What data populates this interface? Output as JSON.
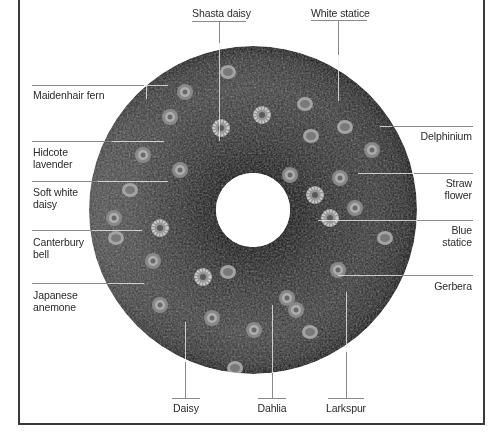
{
  "figure": {
    "colors": {
      "frame": "#3a3a3a",
      "leader_line": "#8a8a8a",
      "text": "#2a2a2a",
      "wreath_dark": "#141414"
    }
  },
  "labels": {
    "top": [
      {
        "id": "shasta-daisy",
        "text": "Shasta daisy"
      },
      {
        "id": "white-statice",
        "text": "White statice"
      }
    ],
    "left": [
      {
        "id": "maidenhair-fern",
        "lines": [
          "Maidenhair fern"
        ]
      },
      {
        "id": "hidcote-lavender",
        "lines": [
          "Hidcote",
          "lavender"
        ]
      },
      {
        "id": "soft-white-daisy",
        "lines": [
          "Soft white",
          "daisy"
        ]
      },
      {
        "id": "canterbury-bell",
        "lines": [
          "Canterbury",
          "bell"
        ]
      },
      {
        "id": "japanese-anemone",
        "lines": [
          "Japanese",
          "anemone"
        ]
      }
    ],
    "right": [
      {
        "id": "delphinium",
        "lines": [
          "Delphinium"
        ]
      },
      {
        "id": "straw-flower",
        "lines": [
          "Straw",
          "flower"
        ]
      },
      {
        "id": "blue-statice",
        "lines": [
          "Blue",
          "statice"
        ]
      },
      {
        "id": "gerbera",
        "lines": [
          "Gerbera"
        ]
      }
    ],
    "bottom": [
      {
        "id": "daisy",
        "text": "Daisy"
      },
      {
        "id": "dahlia",
        "text": "Dahlia"
      },
      {
        "id": "larkspur",
        "text": "Larkspur"
      }
    ]
  }
}
